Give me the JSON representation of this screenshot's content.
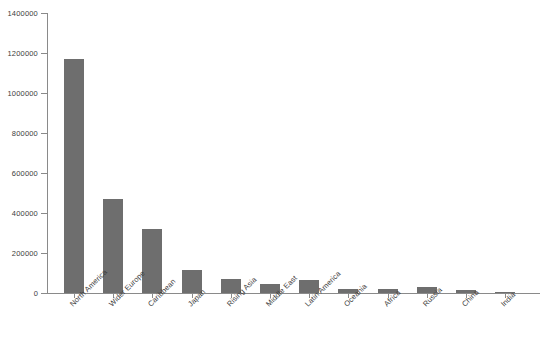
{
  "chart_data": {
    "type": "bar",
    "title": "",
    "subtitle": "",
    "xlabel": "",
    "ylabel": "",
    "grid": false,
    "legend": "none",
    "ylim": [
      0,
      1400000
    ],
    "ytick_labels": [
      "0",
      "200000",
      "400000",
      "600000",
      "800000",
      "1000000",
      "1200000",
      "1400000"
    ],
    "ytick_values": [
      0,
      200000,
      400000,
      600000,
      800000,
      1000000,
      1200000,
      1400000
    ],
    "categories": [
      "North America",
      "Wider Europe",
      "Caribbean",
      "Japan",
      "Rising Asia",
      "Middle East",
      "Latin America",
      "Oceania",
      "Africa",
      "Russia",
      "China",
      "India"
    ],
    "values": [
      1170000,
      470000,
      320000,
      115000,
      68000,
      45000,
      65000,
      22000,
      20000,
      28000,
      13000,
      4000
    ],
    "bar_color": "#6e6e6e",
    "axis_color": "#8a8a8a",
    "text_color": "#3c3c3c",
    "background_color": "#ffffff"
  }
}
